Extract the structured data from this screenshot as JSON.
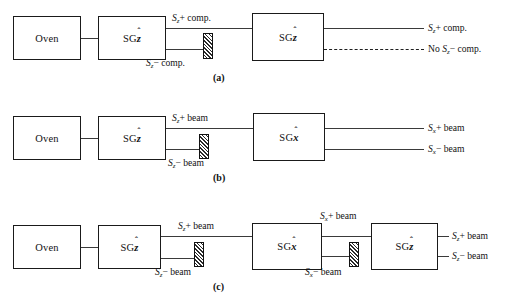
{
  "figure": {
    "colors": {
      "line": "#3a3a3a",
      "box_border": "#1a1a1a",
      "text": "#111111",
      "background": "#ffffff",
      "hatch": "#2a2a2a"
    }
  },
  "panels": [
    {
      "caption": "(a)",
      "boxes": [
        {
          "name": "oven",
          "label": "Oven"
        },
        {
          "name": "sg-z-1",
          "label": "SG",
          "axis": "z",
          "axis_hat": true
        },
        {
          "name": "sg-z-2",
          "label": "SG",
          "axis": "z",
          "axis_hat": true
        }
      ],
      "beam_labels": [
        {
          "name": "beam-label-sz-plus",
          "sym": "S",
          "sub": "z",
          "rest": "+ comp."
        },
        {
          "name": "beam-label-sz-minus",
          "sym": "S",
          "sub": "z",
          "rest": "− comp."
        }
      ],
      "outputs": [
        {
          "name": "output-sz-plus",
          "prefix": "",
          "sym": "S",
          "sub": "z",
          "rest": "+ comp.",
          "style": "solid"
        },
        {
          "name": "output-no-sz-minus",
          "prefix": "No ",
          "sym": "S",
          "sub": "z",
          "rest": "− comp.",
          "style": "dashed"
        }
      ],
      "blockers": [
        {
          "name": "beam-blocker-sz-minus"
        }
      ]
    },
    {
      "caption": "(b)",
      "boxes": [
        {
          "name": "oven",
          "label": "Oven"
        },
        {
          "name": "sg-z-1",
          "label": "SG",
          "axis": "z",
          "axis_hat": true
        },
        {
          "name": "sg-x-1",
          "label": "SG",
          "axis": "x",
          "axis_hat": true
        }
      ],
      "beam_labels": [
        {
          "name": "beam-label-sz-plus",
          "sym": "S",
          "sub": "z",
          "rest": "+ beam"
        },
        {
          "name": "beam-label-sz-minus",
          "sym": "S",
          "sub": "z",
          "rest": "− beam"
        }
      ],
      "outputs": [
        {
          "name": "output-sx-plus",
          "prefix": "",
          "sym": "S",
          "sub": "x",
          "rest": "+ beam",
          "style": "solid"
        },
        {
          "name": "output-sx-minus",
          "prefix": "",
          "sym": "S",
          "sub": "x",
          "rest": "− beam",
          "style": "solid"
        }
      ],
      "blockers": [
        {
          "name": "beam-blocker-sz-minus"
        }
      ]
    },
    {
      "caption": "(c)",
      "boxes": [
        {
          "name": "oven",
          "label": "Oven"
        },
        {
          "name": "sg-z-1",
          "label": "SG",
          "axis": "z",
          "axis_hat": true
        },
        {
          "name": "sg-x-1",
          "label": "SG",
          "axis": "x",
          "axis_hat": true
        },
        {
          "name": "sg-z-2",
          "label": "SG",
          "axis": "z",
          "axis_hat": true
        }
      ],
      "beam_labels": [
        {
          "name": "beam-label-sz-plus",
          "sym": "S",
          "sub": "z",
          "rest": "+ beam"
        },
        {
          "name": "beam-label-sz-minus",
          "sym": "S",
          "sub": "z",
          "rest": "− beam"
        },
        {
          "name": "beam-label-sx-plus",
          "sym": "S",
          "sub": "x",
          "rest": "+ beam"
        },
        {
          "name": "beam-label-sx-minus",
          "sym": "S",
          "sub": "x",
          "rest": "− beam"
        }
      ],
      "outputs": [
        {
          "name": "output-sz-plus",
          "prefix": "",
          "sym": "S",
          "sub": "z",
          "rest": "+ beam",
          "style": "solid"
        },
        {
          "name": "output-sz-minus",
          "prefix": "",
          "sym": "S",
          "sub": "z",
          "rest": "− beam",
          "style": "solid"
        }
      ],
      "blockers": [
        {
          "name": "beam-blocker-sz-minus"
        },
        {
          "name": "beam-blocker-sx-minus"
        }
      ]
    }
  ],
  "labels": {
    "oven": "Oven",
    "sg": "SG",
    "z_hat_char": "z",
    "x_hat_char": "x",
    "hat_mark": "ˆ",
    "caption_a": "(a)",
    "caption_b": "(b)",
    "caption_c": "(c)",
    "sz_plus_comp": "+ comp.",
    "sz_minus_comp": "− comp.",
    "plus_beam": "+ beam",
    "minus_beam": "− beam",
    "no_prefix": "No ",
    "S": "S",
    "sub_z": "z",
    "sub_x": "x"
  }
}
